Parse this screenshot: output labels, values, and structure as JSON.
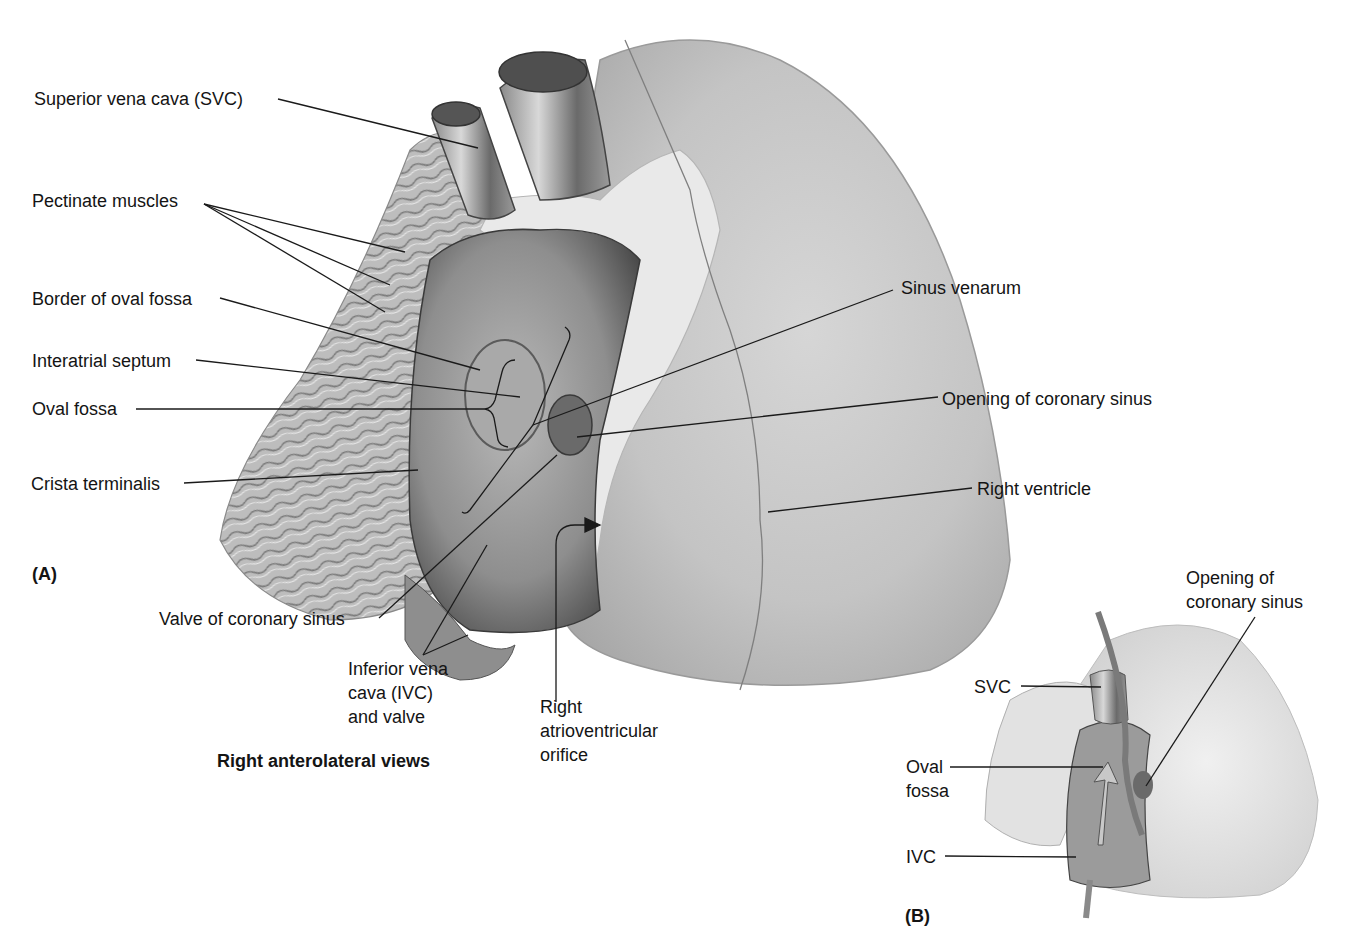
{
  "figure": {
    "caption": "Right anterolateral views",
    "panels": {
      "a": "(A)",
      "b": "(B)"
    }
  },
  "panel_a": {
    "labels": {
      "svc": "Superior vena cava (SVC)",
      "pectinate": "Pectinate muscles",
      "border_oval_fossa": "Border of oval fossa",
      "interatrial_septum": "Interatrial septum",
      "oval_fossa": "Oval fossa",
      "crista_terminalis": "Crista terminalis",
      "sinus_venarum": "Sinus venarum",
      "opening_coronary_sinus": "Opening of coronary sinus",
      "right_ventricle": "Right ventricle",
      "valve_coronary_sinus": "Valve of coronary sinus",
      "ivc_line1": "Inferior vena",
      "ivc_line2": "cava (IVC)",
      "ivc_line3": "and valve",
      "av_line1": "Right",
      "av_line2": "atrioventricular",
      "av_line3": "orifice"
    }
  },
  "panel_b": {
    "labels": {
      "opening_line1": "Opening of",
      "opening_line2": "coronary sinus",
      "svc": "SVC",
      "oval_line1": "Oval",
      "oval_line2": "fossa",
      "ivc": "IVC"
    }
  },
  "colors": {
    "background": "#ffffff",
    "tissue_light": "#e4e4e4",
    "tissue_mid": "#b8b8b8",
    "tissue_dark": "#5a5a5a",
    "leader_line": "#1a1a1a"
  }
}
